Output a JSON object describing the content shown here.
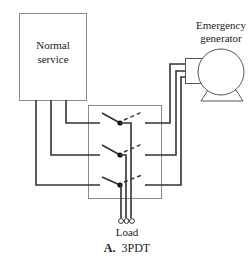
{
  "diagram": {
    "normal_service": {
      "line1": "Normal",
      "line2": "service"
    },
    "generator": {
      "line1": "Emergency",
      "line2": "generator"
    },
    "load_label": "Load",
    "caption": {
      "prefix": "A.",
      "text": "3PDT"
    },
    "switch_type": "three-pole double-throw",
    "poles": 3,
    "colors": {
      "wire": "#333333",
      "box": "#777777",
      "background": "#ffffff"
    }
  }
}
